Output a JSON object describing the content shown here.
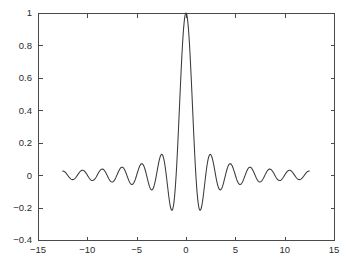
{
  "chart_data": {
    "type": "line",
    "title": "",
    "subtitle": "",
    "xlabel": "",
    "ylabel": "",
    "xlim": [
      -15,
      15
    ],
    "ylim": [
      -0.4,
      1
    ],
    "grid": false,
    "legend": null,
    "legend_position": "none",
    "xticks": [
      -15,
      -10,
      -5,
      0,
      5,
      10,
      15
    ],
    "xtick_labels": [
      "−15",
      "−10",
      "−5",
      "0",
      "5",
      "10",
      "15"
    ],
    "yticks": [
      -0.4,
      -0.2,
      0,
      0.2,
      0.4,
      0.6,
      0.8,
      1
    ],
    "ytick_labels": [
      "−0.4",
      "−0.2",
      "0",
      "0.2",
      "0.4",
      "0.6",
      "0.8",
      "1"
    ],
    "series": [
      {
        "name": "sinc",
        "color": "#3a3a3a",
        "function": "sin(pi*x)/(pi*x)",
        "x_start": -12.5,
        "x_end": 12.5,
        "x_step": 0.05,
        "annotations": [
          {
            "label": "main lobe peak",
            "x": 0,
            "y": 1
          },
          {
            "label": "first negative lobe",
            "x": -4.49,
            "y": -0.217
          },
          {
            "label": "second positive lobe",
            "x": -7.73,
            "y": 0.128
          },
          {
            "label": "second negative lobe",
            "x": -10.9,
            "y": -0.091
          },
          {
            "label": "first negative lobe right",
            "x": 4.49,
            "y": -0.217
          },
          {
            "label": "second positive lobe right",
            "x": 7.73,
            "y": 0.128
          },
          {
            "label": "second negative lobe right",
            "x": 10.9,
            "y": -0.091
          }
        ],
        "zero_crossings": [
          -12,
          -11,
          -10,
          -9,
          -8,
          -7,
          -6,
          -5,
          -4,
          -3,
          -2,
          -1,
          1,
          2,
          3,
          4,
          5,
          6,
          7,
          8,
          9,
          10,
          11,
          12
        ]
      }
    ]
  },
  "figure": {
    "background_color": "#ffffff",
    "axes_color": "#4a4a4a",
    "tick_label_color": "#2b2b2b",
    "box_left": 38,
    "box_top": 13,
    "box_right": 334,
    "box_bottom": 240
  }
}
